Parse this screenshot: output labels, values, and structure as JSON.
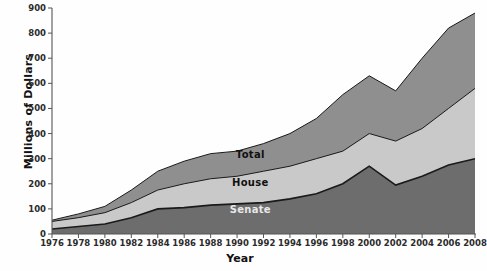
{
  "chart_data": {
    "type": "area",
    "title": "",
    "xlabel": "Year",
    "ylabel": "Millions of Dollars",
    "stacked": true,
    "grid": false,
    "legend_position": "inline-labels",
    "xlim": [
      1976,
      2008
    ],
    "ylim": [
      0,
      900
    ],
    "ytick_step": 100,
    "xtick_step": 2,
    "x": [
      1976,
      1978,
      1980,
      1982,
      1984,
      1986,
      1988,
      1990,
      1992,
      1994,
      1996,
      1998,
      2000,
      2002,
      2004,
      2006,
      2008
    ],
    "xticklabels": [
      "1976",
      "1978",
      "1980",
      "1982",
      "1984",
      "1986",
      "1988",
      "1990",
      "1992",
      "1994",
      "1996",
      "1998",
      "2000",
      "2002",
      "2004",
      "2006",
      "2008"
    ],
    "yticklabels": [
      "0",
      "100",
      "200",
      "300",
      "400",
      "500",
      "600",
      "700",
      "800",
      "900"
    ],
    "series": [
      {
        "name": "Senate",
        "color": "#6d6d6d",
        "label_color": "#e8e8e8",
        "cumulative_top": [
          20,
          30,
          40,
          65,
          100,
          105,
          115,
          120,
          125,
          140,
          160,
          200,
          270,
          195,
          230,
          275,
          300
        ],
        "values": [
          20,
          30,
          40,
          65,
          100,
          105,
          115,
          120,
          125,
          140,
          160,
          200,
          270,
          195,
          230,
          275,
          300
        ]
      },
      {
        "name": "House",
        "color": "#c9c9c9",
        "label_color": "#111111",
        "cumulative_top": [
          50,
          65,
          85,
          125,
          175,
          200,
          220,
          230,
          250,
          270,
          300,
          330,
          400,
          370,
          420,
          500,
          580
        ],
        "values": [
          30,
          35,
          45,
          60,
          75,
          95,
          105,
          110,
          125,
          130,
          140,
          130,
          130,
          175,
          190,
          225,
          280
        ]
      },
      {
        "name": "Total",
        "color": "#8f8f8f",
        "label_color": "#111111",
        "cumulative_top": [
          55,
          80,
          110,
          175,
          250,
          290,
          320,
          330,
          360,
          400,
          460,
          555,
          630,
          570,
          700,
          820,
          880
        ],
        "values": [
          5,
          15,
          25,
          50,
          75,
          90,
          100,
          100,
          110,
          130,
          160,
          225,
          230,
          200,
          280,
          320,
          300
        ]
      }
    ],
    "series_label_positions": [
      {
        "name": "Total",
        "x": 1991.0,
        "y": 318
      },
      {
        "name": "House",
        "x": 1991.0,
        "y": 208
      },
      {
        "name": "Senate",
        "x": 1991.0,
        "y": 100
      }
    ],
    "line_color": "#1a1a1a",
    "axis_color": "#555555"
  }
}
